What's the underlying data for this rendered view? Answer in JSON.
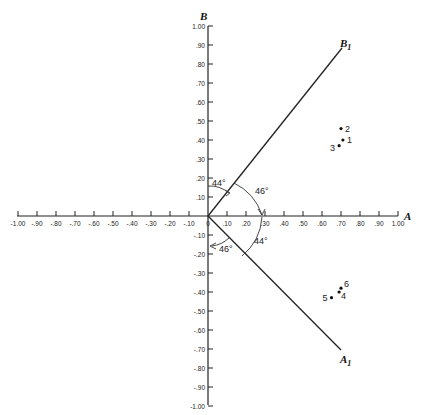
{
  "chart_data": {
    "type": "scatter",
    "title": "",
    "xlabel": "A",
    "ylabel": "B",
    "xlim": [
      -1.0,
      1.0
    ],
    "ylim": [
      -1.0,
      1.0
    ],
    "grid": false,
    "x_ticks": [
      "-1.00",
      "-.90",
      "-.80",
      "-.70",
      "-.60",
      "-.50",
      "-.40",
      "-.30",
      "-.20",
      "-.10",
      "0",
      ".10",
      ".20",
      ".30",
      ".40",
      ".50",
      ".60",
      ".70",
      ".80",
      ".90",
      "1.00"
    ],
    "y_ticks": [
      "1.00",
      ".90",
      ".80",
      ".70",
      ".60",
      ".50",
      ".40",
      ".30",
      ".20",
      ".10",
      "-.10",
      "-.20",
      "-.30",
      "-.40",
      "-.50",
      "-.60",
      "-.70",
      "-.80",
      "-.90",
      "-1.00"
    ],
    "rotated_axes": [
      {
        "name": "B1",
        "label_main": "B",
        "label_sub": "1",
        "end": [
          0.7,
          0.7
        ]
      },
      {
        "name": "A1",
        "label_main": "A",
        "label_sub": "1",
        "end": [
          0.7,
          -0.7
        ]
      }
    ],
    "angle_annotations": [
      {
        "label": "44°",
        "between": "B and B1"
      },
      {
        "label": "46°",
        "between": "B1 and A"
      },
      {
        "label": "44°",
        "between": "A and A1"
      },
      {
        "label": "46°",
        "between": "A1 and -B"
      }
    ],
    "points": [
      {
        "label": "1",
        "x": 0.71,
        "y": 0.4
      },
      {
        "label": "2",
        "x": 0.7,
        "y": 0.46
      },
      {
        "label": "3",
        "x": 0.69,
        "y": 0.37
      },
      {
        "label": "4",
        "x": 0.69,
        "y": -0.4
      },
      {
        "label": "5",
        "x": 0.65,
        "y": -0.43
      },
      {
        "label": "6",
        "x": 0.7,
        "y": -0.38
      }
    ]
  },
  "labels": {
    "axis_a": "A",
    "axis_b": "B",
    "b1_main": "B",
    "b1_sub": "1",
    "a1_main": "A",
    "a1_sub": "1",
    "angle_44_top": "44°",
    "angle_46_right": "46°",
    "angle_44_bottom": "44°",
    "angle_46_bottom": "46°"
  }
}
